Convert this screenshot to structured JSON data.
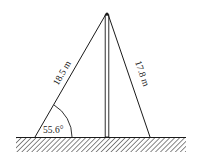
{
  "diagram": {
    "type": "pole-with-guy-wires",
    "left_wire": {
      "length_label": "18.5 m"
    },
    "right_wire": {
      "length_label": "17.8 m"
    },
    "angle": {
      "label": "55.6°",
      "location": "between left wire and ground"
    },
    "colors": {
      "line": "#1a1a1a",
      "ground_hatch": "#555555",
      "background": "#ffffff"
    }
  }
}
